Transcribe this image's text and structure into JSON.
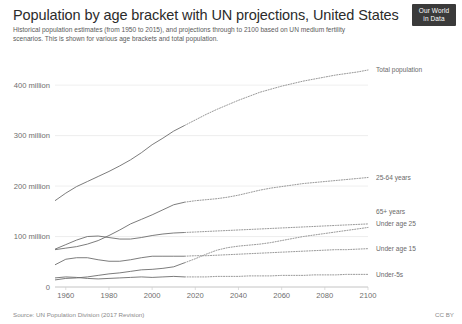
{
  "header": {
    "title": "Population by age bracket with UN projections, United States",
    "subtitle": "Historical population estimates (from 1950 to 2015), and projections through to 2100 based on UN medium fertility scenarios. This is shown for various age brackets and total population.",
    "logo_line1": "Our World",
    "logo_line2": "in Data"
  },
  "footer": {
    "source": "Source: UN Population Division (2017 Revision)",
    "license": "CC BY"
  },
  "chart_data": {
    "type": "line",
    "title": "Population by age bracket with UN projections, United States",
    "subtitle": "Historical population estimates (from 1950 to 2015), and projections through to 2100 based on UN medium fertility scenarios. This is shown for various age brackets and total population.",
    "xlabel": "",
    "ylabel": "",
    "xlim": [
      1955,
      2100
    ],
    "ylim": [
      0,
      430
    ],
    "grid": true,
    "legend_position": "right-inline",
    "projection_start_year": 2015,
    "value_unit": "millions",
    "xticks": [
      1960,
      1980,
      2000,
      2020,
      2040,
      2060,
      2080,
      2100
    ],
    "xtick_labels": [
      "1960",
      "1980",
      "2000",
      "2020",
      "2040",
      "2060",
      "2080",
      "2100"
    ],
    "yticks": [
      0,
      100,
      200,
      300,
      400
    ],
    "ytick_labels": [
      "0",
      "100 million",
      "200 million",
      "300 million",
      "400 million"
    ],
    "x": [
      1955,
      1960,
      1965,
      1970,
      1975,
      1980,
      1985,
      1990,
      1995,
      2000,
      2005,
      2010,
      2015,
      2020,
      2025,
      2030,
      2035,
      2040,
      2045,
      2050,
      2055,
      2060,
      2065,
      2070,
      2075,
      2080,
      2085,
      2090,
      2095,
      2100
    ],
    "series": [
      {
        "name": "Total population",
        "label": "Total population",
        "color": "#6d6d6d",
        "values": [
          171,
          186,
          199,
          209,
          219,
          229,
          240,
          252,
          266,
          282,
          295,
          309,
          320,
          331,
          342,
          352,
          361,
          370,
          378,
          386,
          392,
          398,
          403,
          408,
          412,
          416,
          420,
          423,
          426,
          430
        ]
      },
      {
        "name": "25-64 years",
        "label": "25-64 years",
        "color": "#6d6d6d",
        "values": [
          74,
          77,
          80,
          85,
          92,
          102,
          113,
          125,
          134,
          143,
          153,
          163,
          168,
          171,
          173,
          175,
          178,
          182,
          187,
          192,
          196,
          199,
          202,
          205,
          207,
          209,
          211,
          213,
          215,
          217
        ]
      },
      {
        "name": "Under age 25",
        "label": "Under age 25",
        "color": "#6d6d6d",
        "values": [
          75,
          84,
          93,
          100,
          101,
          98,
          95,
          95,
          98,
          102,
          105,
          107,
          108,
          109,
          110,
          111,
          112,
          113,
          114,
          115,
          116,
          117,
          118,
          119,
          120,
          121,
          122,
          123,
          124,
          125
        ]
      },
      {
        "name": "65+ years",
        "label": "65+ years",
        "color": "#6d6d6d",
        "values": [
          14,
          17,
          18,
          20,
          23,
          26,
          28,
          31,
          34,
          35,
          37,
          40,
          48,
          56,
          65,
          73,
          78,
          81,
          83,
          85,
          88,
          92,
          96,
          100,
          103,
          106,
          109,
          112,
          115,
          118
        ]
      },
      {
        "name": "Under age 15",
        "label": "Under age 15",
        "color": "#6d6d6d",
        "values": [
          44,
          55,
          58,
          58,
          54,
          51,
          51,
          54,
          58,
          61,
          61,
          61,
          61,
          62,
          62,
          63,
          64,
          65,
          66,
          67,
          68,
          69,
          70,
          71,
          72,
          73,
          74,
          74,
          75,
          76
        ]
      },
      {
        "name": "Under-5s",
        "label": "Under-5s",
        "color": "#6d6d6d",
        "values": [
          18,
          20,
          19,
          17,
          16,
          17,
          18,
          19,
          20,
          19,
          20,
          21,
          20,
          20,
          20,
          21,
          21,
          21,
          22,
          22,
          22,
          23,
          23,
          23,
          24,
          24,
          24,
          25,
          25,
          25
        ]
      }
    ],
    "series_label_positions": [
      {
        "name": "Total population",
        "y_value": 430
      },
      {
        "name": "25-64 years",
        "y_value": 217
      },
      {
        "name": "65+ years",
        "y_value": 150
      },
      {
        "name": "Under age 25",
        "y_value": 125
      },
      {
        "name": "Under age 15",
        "y_value": 76
      },
      {
        "name": "Under-5s",
        "y_value": 25
      }
    ]
  }
}
